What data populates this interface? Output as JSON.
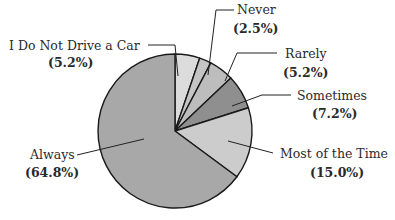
{
  "chart_data": {
    "type": "pie",
    "title": "",
    "start_angle_deg": 0,
    "direction": "clockwise",
    "slices": [
      {
        "label": "I Do Not Drive a Car",
        "pct_text": "(5.2%)",
        "value": 5.2,
        "color": "#dcdcdc"
      },
      {
        "label": "Never",
        "pct_text": "(2.5%)",
        "value": 2.5,
        "color": "#c4c4c4"
      },
      {
        "label": "Rarely",
        "pct_text": "(5.2%)",
        "value": 5.2,
        "color": "#bdbdbd"
      },
      {
        "label": "Sometimes",
        "pct_text": "(7.2%)",
        "value": 7.2,
        "color": "#8f8f8f"
      },
      {
        "label": "Most of the Time",
        "pct_text": "(15.0%)",
        "value": 15.0,
        "color": "#cccccc"
      },
      {
        "label": "Always",
        "pct_text": "(64.8%)",
        "value": 64.8,
        "color": "#a8a8a8"
      }
    ],
    "legend": "none (leader-line labels)"
  },
  "labels": {
    "no_car": {
      "name": "I Do Not Drive a Car",
      "pct": "(5.2%)"
    },
    "never": {
      "name": "Never",
      "pct": "(2.5%)"
    },
    "rarely": {
      "name": "Rarely",
      "pct": "(5.2%)"
    },
    "sometimes": {
      "name": "Sometimes",
      "pct": "(7.2%)"
    },
    "most": {
      "name": "Most of the Time",
      "pct": "(15.0%)"
    },
    "always": {
      "name": "Always",
      "pct": "(64.8%)"
    }
  }
}
